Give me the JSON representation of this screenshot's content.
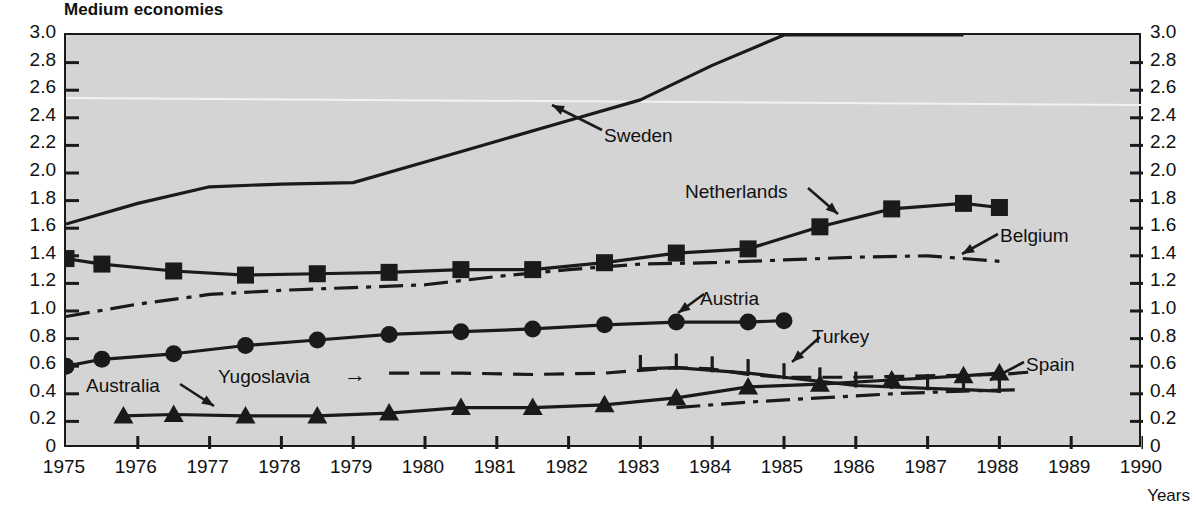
{
  "title": "Medium economies",
  "axis": {
    "x_label": "Years",
    "y_ticks": [
      "3.0",
      "2.8",
      "2.6",
      "2.4",
      "2.2",
      "2.0",
      "1.8",
      "1.6",
      "1.4",
      "1.2",
      "1.0",
      "0.8",
      "0.6",
      "0.4",
      "0.2",
      "0"
    ],
    "x_ticks": [
      "1975",
      "1976",
      "1977",
      "1978",
      "1979",
      "1980",
      "1981",
      "1982",
      "1983",
      "1984",
      "1985",
      "1986",
      "1987",
      "1988",
      "1989",
      "1990"
    ]
  },
  "annotations": {
    "sweden": "Sweden",
    "netherlands": "Netherlands",
    "belgium": "Belgium",
    "austria": "Austria",
    "turkey": "Turkey",
    "spain": "Spain",
    "australia": "Australia",
    "yugoslavia": "Yugoslavia"
  },
  "colors": {
    "plot_background": "#d4d4d4",
    "page_background": "#ffffff",
    "ink": "#1a1a1a"
  },
  "chart_data": {
    "type": "line",
    "title": "Medium economies",
    "xlabel": "Years",
    "ylabel": "",
    "xlim": [
      1975,
      1990
    ],
    "ylim": [
      0,
      3.0
    ],
    "ytick_step": 0.2,
    "grid": false,
    "legend": "inline annotations with arrows",
    "series": [
      {
        "name": "Sweden",
        "style": "solid",
        "marker": "none",
        "x": [
          1975,
          1976,
          1977,
          1978,
          1979,
          1980,
          1981,
          1982,
          1983,
          1984,
          1985,
          1986,
          1987.5
        ],
        "values": [
          1.63,
          1.78,
          1.9,
          1.92,
          1.93,
          2.08,
          2.23,
          2.38,
          2.53,
          2.78,
          3.0,
          3.0,
          3.0
        ]
      },
      {
        "name": "Netherlands",
        "style": "solid",
        "marker": "square",
        "x": [
          1975,
          1975.5,
          1976.5,
          1977.5,
          1978.5,
          1979.5,
          1980.5,
          1981.5,
          1982.5,
          1983.5,
          1984.5,
          1985.5,
          1986.5,
          1987.5,
          1988
        ],
        "values": [
          1.38,
          1.34,
          1.29,
          1.26,
          1.27,
          1.28,
          1.3,
          1.3,
          1.35,
          1.42,
          1.45,
          1.61,
          1.74,
          1.78,
          1.75
        ]
      },
      {
        "name": "Belgium",
        "style": "dash-dot",
        "marker": "none",
        "x": [
          1975,
          1976,
          1977,
          1978,
          1979,
          1980,
          1981,
          1982,
          1983,
          1984,
          1985,
          1986,
          1987,
          1988
        ],
        "values": [
          0.96,
          1.05,
          1.12,
          1.15,
          1.17,
          1.19,
          1.25,
          1.3,
          1.34,
          1.35,
          1.37,
          1.39,
          1.4,
          1.36
        ]
      },
      {
        "name": "Austria",
        "style": "solid",
        "marker": "circle",
        "x": [
          1975,
          1975.5,
          1976.5,
          1977.5,
          1978.5,
          1979.5,
          1980.5,
          1981.5,
          1982.5,
          1983.5,
          1984.5,
          1985
        ],
        "values": [
          0.6,
          0.65,
          0.69,
          0.75,
          0.79,
          0.83,
          0.85,
          0.87,
          0.9,
          0.92,
          0.92,
          0.93
        ]
      },
      {
        "name": "Yugoslavia",
        "style": "dashed",
        "marker": "none",
        "x": [
          1979.5,
          1980.5,
          1981.5,
          1982.5,
          1983,
          1983.5,
          1984,
          1984.5,
          1985,
          1986,
          1987,
          1988,
          1988.5
        ],
        "values": [
          0.55,
          0.55,
          0.54,
          0.55,
          0.57,
          0.59,
          0.58,
          0.54,
          0.52,
          0.52,
          0.53,
          0.54,
          0.56
        ]
      },
      {
        "name": "Australia",
        "style": "solid",
        "marker": "triangle",
        "x": [
          1975.8,
          1976.5,
          1977.5,
          1978.5,
          1979.5,
          1980.5,
          1981.5,
          1982.5,
          1983.5,
          1984.5,
          1985.5,
          1986.5,
          1987.5,
          1988
        ],
        "values": [
          0.24,
          0.25,
          0.24,
          0.24,
          0.26,
          0.3,
          0.3,
          0.32,
          0.37,
          0.45,
          0.47,
          0.5,
          0.53,
          0.55
        ]
      },
      {
        "name": "Turkey",
        "style": "solid",
        "marker": "vertical-tick",
        "x": [
          1983,
          1983.5,
          1984,
          1984.5,
          1985,
          1985.5,
          1986,
          1986.5,
          1987,
          1987.5,
          1988
        ],
        "values": [
          0.58,
          0.59,
          0.57,
          0.55,
          0.52,
          0.49,
          0.46,
          0.45,
          0.44,
          0.43,
          0.42
        ]
      },
      {
        "name": "Spain",
        "style": "dash-dot",
        "marker": "none",
        "x": [
          1983.5,
          1984.5,
          1985.5,
          1986.5,
          1987.5,
          1988.3
        ],
        "values": [
          0.3,
          0.34,
          0.37,
          0.4,
          0.42,
          0.43
        ]
      }
    ]
  }
}
